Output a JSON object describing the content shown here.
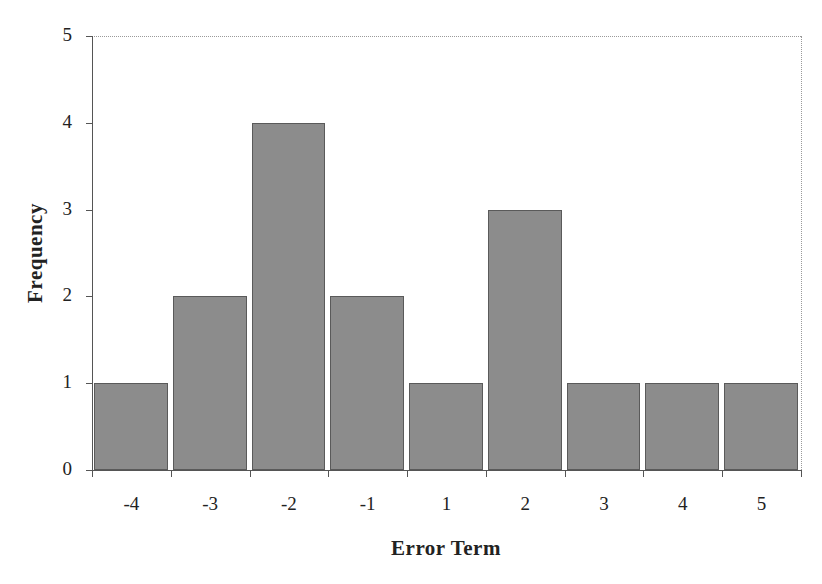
{
  "chart_data": {
    "type": "bar",
    "title": "",
    "xlabel": "Error Term",
    "ylabel": "Frequency",
    "categories": [
      "-4",
      "-3",
      "-2",
      "-1",
      "1",
      "2",
      "3",
      "4",
      "5"
    ],
    "values": [
      1,
      2,
      4,
      2,
      1,
      3,
      1,
      1,
      1
    ],
    "ylim": [
      0,
      5
    ],
    "yticks": [
      "0",
      "1",
      "2",
      "3",
      "4",
      "5"
    ],
    "grid": false,
    "legend": null,
    "bar_color": "#8c8c8c",
    "bar_edge_color": "#5a5a5a"
  }
}
